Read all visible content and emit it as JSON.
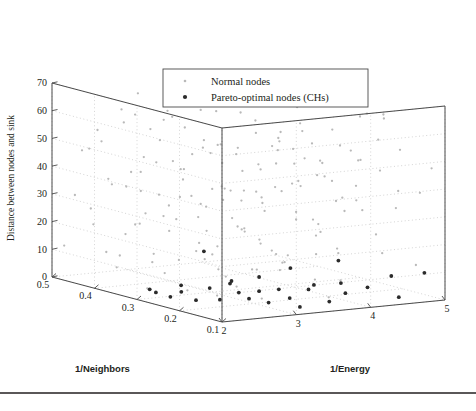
{
  "chart_data": {
    "type": "scatter",
    "title": "",
    "projection": "3d",
    "grid": true,
    "axes": {
      "x": {
        "label": "1/Energy",
        "ticks": [
          2,
          3,
          4,
          5
        ],
        "ticklabels": [
          "2",
          "3",
          "4",
          "5"
        ],
        "lim": [
          2,
          5
        ]
      },
      "y": {
        "label": "1/Neighbors",
        "ticks": [
          0.5,
          0.4,
          0.3,
          0.2,
          0.1
        ],
        "ticklabels": [
          "0.5",
          "0.4",
          "0.3",
          "0.2",
          "0.1"
        ],
        "lim": [
          0.1,
          0.5
        ],
        "reversed": true
      },
      "z": {
        "label": "Distance between nodes and sink",
        "ticks": [
          0,
          10,
          20,
          30,
          40,
          50,
          60,
          70
        ],
        "ticklabels": [
          "0",
          "10",
          "20",
          "30",
          "40",
          "50",
          "60",
          "70"
        ],
        "lim": [
          0,
          70
        ]
      }
    },
    "legend": {
      "position": "top-center",
      "entries": [
        {
          "name": "Normal nodes",
          "marker": "dot",
          "color": "#b9b9b9",
          "size": 1.3
        },
        {
          "name": "Pareto-optimal nodes (CHs)",
          "marker": "dot",
          "color": "#2b2b2b",
          "size": 2.1
        }
      ]
    },
    "series": [
      {
        "name": "Normal nodes",
        "color": "#b9b9b9",
        "points": [
          [
            2.05,
            0.48,
            12
          ],
          [
            2.08,
            0.46,
            31
          ],
          [
            2.06,
            0.44,
            48
          ],
          [
            2.1,
            0.42,
            22
          ],
          [
            2.04,
            0.4,
            57
          ],
          [
            2.12,
            0.38,
            38
          ],
          [
            2.07,
            0.36,
            9
          ],
          [
            2.15,
            0.34,
            44
          ],
          [
            2.09,
            0.32,
            26
          ],
          [
            2.18,
            0.3,
            61
          ],
          [
            2.11,
            0.28,
            17
          ],
          [
            2.2,
            0.26,
            35
          ],
          [
            2.14,
            0.24,
            52
          ],
          [
            2.22,
            0.22,
            6
          ],
          [
            2.16,
            0.2,
            41
          ],
          [
            2.25,
            0.18,
            29
          ],
          [
            2.19,
            0.16,
            58
          ],
          [
            2.28,
            0.14,
            14
          ],
          [
            2.23,
            0.12,
            46
          ],
          [
            2.3,
            0.1,
            33
          ],
          [
            2.35,
            0.47,
            25
          ],
          [
            2.38,
            0.45,
            50
          ],
          [
            2.33,
            0.43,
            11
          ],
          [
            2.42,
            0.41,
            63
          ],
          [
            2.36,
            0.39,
            19
          ],
          [
            2.45,
            0.37,
            42
          ],
          [
            2.4,
            0.35,
            28
          ],
          [
            2.48,
            0.33,
            55
          ],
          [
            2.43,
            0.31,
            8
          ],
          [
            2.52,
            0.29,
            36
          ],
          [
            2.46,
            0.27,
            47
          ],
          [
            2.55,
            0.25,
            21
          ],
          [
            2.5,
            0.23,
            59
          ],
          [
            2.58,
            0.21,
            13
          ],
          [
            2.53,
            0.19,
            39
          ],
          [
            2.61,
            0.17,
            30
          ],
          [
            2.56,
            0.15,
            51
          ],
          [
            2.64,
            0.13,
            16
          ],
          [
            2.59,
            0.11,
            43
          ],
          [
            2.67,
            0.1,
            24
          ],
          [
            2.7,
            0.49,
            34
          ],
          [
            2.74,
            0.47,
            7
          ],
          [
            2.68,
            0.45,
            56
          ],
          [
            2.78,
            0.43,
            20
          ],
          [
            2.72,
            0.41,
            45
          ],
          [
            2.81,
            0.39,
            32
          ],
          [
            2.76,
            0.37,
            60
          ],
          [
            2.85,
            0.35,
            10
          ],
          [
            2.79,
            0.33,
            40
          ],
          [
            2.88,
            0.31,
            27
          ],
          [
            2.83,
            0.29,
            53
          ],
          [
            2.91,
            0.27,
            18
          ],
          [
            2.86,
            0.25,
            49
          ],
          [
            2.94,
            0.23,
            5
          ],
          [
            2.89,
            0.21,
            37
          ],
          [
            2.97,
            0.19,
            62
          ],
          [
            2.92,
            0.17,
            23
          ],
          [
            3.0,
            0.15,
            44
          ],
          [
            2.95,
            0.13,
            15
          ],
          [
            3.03,
            0.11,
            54
          ],
          [
            3.08,
            0.48,
            29
          ],
          [
            3.12,
            0.46,
            4
          ],
          [
            3.06,
            0.44,
            41
          ],
          [
            3.16,
            0.42,
            58
          ],
          [
            3.1,
            0.4,
            22
          ],
          [
            3.2,
            0.38,
            46
          ],
          [
            3.14,
            0.36,
            12
          ],
          [
            3.24,
            0.34,
            35
          ],
          [
            3.18,
            0.32,
            64
          ],
          [
            3.28,
            0.3,
            26
          ],
          [
            3.22,
            0.28,
            50
          ],
          [
            3.32,
            0.26,
            9
          ],
          [
            3.26,
            0.24,
            38
          ],
          [
            3.36,
            0.22,
            55
          ],
          [
            3.3,
            0.2,
            17
          ],
          [
            3.4,
            0.18,
            43
          ],
          [
            3.34,
            0.16,
            31
          ],
          [
            3.44,
            0.14,
            59
          ],
          [
            3.38,
            0.12,
            20
          ],
          [
            3.48,
            0.1,
            47
          ],
          [
            3.52,
            0.49,
            13
          ],
          [
            3.56,
            0.47,
            36
          ],
          [
            3.5,
            0.45,
            52
          ],
          [
            3.6,
            0.43,
            25
          ],
          [
            3.54,
            0.41,
            6
          ],
          [
            3.64,
            0.39,
            48
          ],
          [
            3.58,
            0.37,
            33
          ],
          [
            3.68,
            0.35,
            61
          ],
          [
            3.62,
            0.33,
            19
          ],
          [
            3.72,
            0.31,
            42
          ],
          [
            3.66,
            0.29,
            28
          ],
          [
            3.76,
            0.27,
            57
          ],
          [
            3.7,
            0.25,
            11
          ],
          [
            3.8,
            0.23,
            39
          ],
          [
            3.74,
            0.21,
            50
          ],
          [
            3.84,
            0.19,
            24
          ],
          [
            3.78,
            0.17,
            45
          ],
          [
            3.88,
            0.15,
            8
          ],
          [
            3.82,
            0.13,
            34
          ],
          [
            3.92,
            0.11,
            53
          ],
          [
            3.96,
            0.48,
            21
          ],
          [
            4.0,
            0.46,
            44
          ],
          [
            3.94,
            0.44,
            30
          ],
          [
            4.05,
            0.42,
            60
          ],
          [
            3.98,
            0.4,
            16
          ],
          [
            4.09,
            0.38,
            40
          ],
          [
            4.03,
            0.36,
            27
          ],
          [
            4.13,
            0.34,
            51
          ],
          [
            4.07,
            0.32,
            7
          ],
          [
            4.17,
            0.3,
            37
          ],
          [
            4.11,
            0.28,
            56
          ],
          [
            4.21,
            0.26,
            23
          ],
          [
            4.15,
            0.24,
            46
          ],
          [
            4.25,
            0.22,
            14
          ],
          [
            4.19,
            0.2,
            35
          ],
          [
            4.29,
            0.18,
            49
          ],
          [
            4.23,
            0.16,
            32
          ],
          [
            4.33,
            0.14,
            58
          ],
          [
            4.27,
            0.12,
            18
          ],
          [
            4.37,
            0.1,
            41
          ],
          [
            4.41,
            0.47,
            26
          ],
          [
            4.45,
            0.45,
            52
          ],
          [
            4.39,
            0.43,
            10
          ],
          [
            4.5,
            0.41,
            38
          ],
          [
            4.43,
            0.39,
            47
          ],
          [
            4.54,
            0.37,
            22
          ],
          [
            4.48,
            0.35,
            55
          ],
          [
            4.58,
            0.33,
            15
          ],
          [
            4.52,
            0.31,
            43
          ],
          [
            4.62,
            0.29,
            29
          ],
          [
            4.56,
            0.27,
            50
          ],
          [
            4.66,
            0.25,
            36
          ],
          [
            4.6,
            0.23,
            62
          ],
          [
            4.7,
            0.21,
            20
          ],
          [
            4.64,
            0.19,
            44
          ],
          [
            4.74,
            0.17,
            31
          ],
          [
            4.68,
            0.15,
            53
          ],
          [
            4.78,
            0.13,
            12
          ],
          [
            4.72,
            0.11,
            39
          ],
          [
            4.82,
            0.1,
            48
          ],
          [
            4.86,
            0.46,
            25
          ],
          [
            4.9,
            0.44,
            41
          ],
          [
            4.84,
            0.42,
            57
          ],
          [
            4.94,
            0.4,
            17
          ],
          [
            4.88,
            0.38,
            34
          ],
          [
            4.97,
            0.36,
            51
          ],
          [
            4.92,
            0.34,
            9
          ],
          [
            4.99,
            0.32,
            45
          ],
          [
            4.95,
            0.3,
            28
          ],
          [
            4.98,
            0.28,
            60
          ],
          [
            2.26,
            0.35,
            64
          ],
          [
            2.31,
            0.33,
            2
          ],
          [
            2.41,
            0.3,
            67
          ],
          [
            2.62,
            0.22,
            3
          ],
          [
            2.87,
            0.45,
            66
          ],
          [
            3.05,
            0.19,
            2
          ],
          [
            3.29,
            0.37,
            65
          ],
          [
            3.55,
            0.12,
            4
          ],
          [
            3.85,
            0.26,
            68
          ],
          [
            4.1,
            0.49,
            3
          ],
          [
            4.35,
            0.13,
            66
          ],
          [
            4.6,
            0.4,
            5
          ],
          [
            4.8,
            0.21,
            63
          ],
          [
            2.5,
            0.5,
            45
          ],
          [
            3.0,
            0.5,
            30
          ],
          [
            3.5,
            0.5,
            18
          ],
          [
            4.0,
            0.5,
            55
          ],
          [
            4.5,
            0.5,
            40
          ],
          [
            2.75,
            0.1,
            60
          ],
          [
            3.25,
            0.1,
            12
          ]
        ]
      },
      {
        "name": "Pareto-optimal nodes (CHs)",
        "color": "#2b2b2b",
        "points": [
          [
            2.14,
            0.28,
            3
          ],
          [
            2.22,
            0.26,
            2
          ],
          [
            2.31,
            0.25,
            4
          ],
          [
            2.45,
            0.24,
            1
          ],
          [
            2.52,
            0.22,
            6
          ],
          [
            2.6,
            0.21,
            2
          ],
          [
            2.68,
            0.2,
            8
          ],
          [
            2.74,
            0.19,
            5
          ],
          [
            2.82,
            0.18,
            3
          ],
          [
            2.9,
            0.17,
            11
          ],
          [
            2.97,
            0.16,
            2
          ],
          [
            3.05,
            0.15,
            7
          ],
          [
            3.14,
            0.14,
            4
          ],
          [
            3.22,
            0.13,
            1
          ],
          [
            3.35,
            0.12,
            9
          ],
          [
            3.5,
            0.11,
            3
          ],
          [
            3.66,
            0.1,
            6
          ],
          [
            3.85,
            0.22,
            2
          ],
          [
            4.08,
            0.19,
            13
          ],
          [
            4.3,
            0.16,
            4
          ],
          [
            4.55,
            0.13,
            1
          ],
          [
            4.78,
            0.11,
            10
          ],
          [
            2.9,
            0.3,
            15
          ],
          [
            3.1,
            0.27,
            5
          ],
          [
            3.3,
            0.24,
            2
          ],
          [
            2.4,
            0.34,
            1
          ],
          [
            2.65,
            0.31,
            3
          ],
          [
            3.95,
            0.28,
            7
          ],
          [
            4.4,
            0.24,
            2
          ],
          [
            4.85,
            0.2,
            5
          ]
        ]
      }
    ]
  },
  "axis_labels": {
    "z_title": "Distance between nodes and sink",
    "x_title": "1/Energy",
    "y_title": "1/Neighbors"
  },
  "legend_items": [
    {
      "label": "Normal nodes"
    },
    {
      "label": "Pareto-optimal nodes (CHs)"
    }
  ],
  "z_ticks": [
    "70",
    "60",
    "50",
    "40",
    "30",
    "20",
    "10",
    "0"
  ],
  "y_ticks": [
    "0.5",
    "0.4",
    "0.3",
    "0.2",
    "0.1"
  ],
  "x_ticks": [
    "2",
    "3",
    "4",
    "5"
  ],
  "caption": ""
}
